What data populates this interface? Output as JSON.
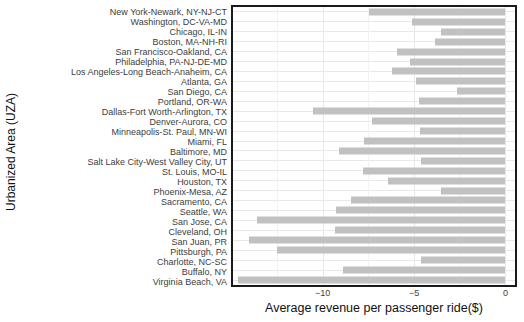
{
  "chart_data": {
    "type": "bar",
    "orientation": "horizontal",
    "title": "",
    "xlabel": "Average revenue per passenger ride($)",
    "ylabel": "Urbanized Area (UZA)",
    "xlim": [
      -14.9,
      0.52
    ],
    "x_ticks": [
      -10,
      -5,
      0
    ],
    "x_tick_labels": [
      "−10",
      "−5",
      "0"
    ],
    "x_minor_ticks": [
      -12.5,
      -7.5,
      -2.5
    ],
    "grid": true,
    "legend": "none",
    "bar_color": "#c1c1c1",
    "frame_color": "#1a1a1a",
    "grid_major_color": "#e8e8e8",
    "grid_minor_color": "#f2f2f2",
    "categories": [
      "New York-Newark, NY-NJ-CT",
      "Washington, DC-VA-MD",
      "Chicago, IL-IN",
      "Boston, MA-NH-RI",
      "San Francisco-Oakland, CA",
      "Philadelphia, PA-NJ-DE-MD",
      "Los Angeles-Long Beach-Anaheim, CA",
      "Atlanta, GA",
      "San Diego, CA",
      "Portland, OR-WA",
      "Dallas-Fort Worth-Arlington, TX",
      "Denver-Aurora, CO",
      "Minneapolis-St. Paul, MN-WI",
      "Miami, FL",
      "Baltimore, MD",
      "Salt Lake City-West Valley City, UT",
      "St. Louis, MO-IL",
      "Houston, TX",
      "Phoenix-Mesa, AZ",
      "Sacramento, CA",
      "Seattle, WA",
      "San Jose, CA",
      "Cleveland, OH",
      "San Juan, PR",
      "Pittsburgh, PA",
      "Charlotte, NC-SC",
      "Buffalo, NY",
      "Virginia Beach, VA"
    ],
    "values": [
      -7.45,
      -5.1,
      -3.55,
      -3.85,
      -5.95,
      -5.2,
      -6.2,
      -4.9,
      -2.65,
      -4.75,
      -10.5,
      -7.3,
      -4.65,
      -7.75,
      -9.1,
      -4.6,
      -7.8,
      -6.4,
      -3.55,
      -8.45,
      -9.25,
      -13.6,
      -9.3,
      -14.0,
      -12.5,
      -4.6,
      -8.9,
      -14.6
    ]
  }
}
